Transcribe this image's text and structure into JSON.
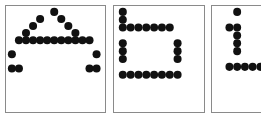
{
  "figure": {
    "background_color": "#ffffff",
    "border_color": "#8a8a8a",
    "dot_color": "#111111",
    "panel_count": 3
  },
  "panels": [
    {
      "id": "panel-letter-a",
      "letter": "A",
      "case": "uppercase",
      "clipped": false,
      "x": 5,
      "y": 5,
      "width": 101,
      "height": 108,
      "grid": {
        "cols": 13,
        "rows": 10,
        "cell": 7.2,
        "origin_x": 6,
        "origin_y": 6
      },
      "dot_radius": 4.1,
      "dots": [
        [
          6,
          0
        ],
        [
          4,
          1
        ],
        [
          7,
          1
        ],
        [
          3,
          2
        ],
        [
          8,
          2
        ],
        [
          2,
          3
        ],
        [
          9,
          3
        ],
        [
          1,
          4
        ],
        [
          2,
          4
        ],
        [
          3,
          4
        ],
        [
          4,
          4
        ],
        [
          5,
          4
        ],
        [
          6,
          4
        ],
        [
          7,
          4
        ],
        [
          8,
          4
        ],
        [
          9,
          4
        ],
        [
          10,
          4
        ],
        [
          11,
          4
        ],
        [
          0,
          6
        ],
        [
          12,
          6
        ],
        [
          0,
          8
        ],
        [
          1,
          8
        ],
        [
          11,
          8
        ],
        [
          12,
          8
        ]
      ]
    },
    {
      "id": "panel-letter-h",
      "letter": "h",
      "case": "lowercase",
      "clipped": false,
      "x": 113,
      "y": 5,
      "width": 92,
      "height": 108,
      "grid": {
        "cols": 10,
        "rows": 10,
        "cell": 8.0,
        "origin_x": 9,
        "origin_y": 6
      },
      "dot_radius": 4.1,
      "dots": [
        [
          0,
          0
        ],
        [
          0,
          1
        ],
        [
          0,
          2
        ],
        [
          1,
          2
        ],
        [
          2,
          2
        ],
        [
          3,
          2
        ],
        [
          4,
          2
        ],
        [
          5,
          2
        ],
        [
          6,
          2
        ],
        [
          0,
          4
        ],
        [
          7,
          4
        ],
        [
          0,
          5
        ],
        [
          7,
          5
        ],
        [
          0,
          6
        ],
        [
          7,
          6
        ],
        [
          0,
          8
        ],
        [
          1,
          8
        ],
        [
          2,
          8
        ],
        [
          3,
          8
        ],
        [
          4,
          8
        ],
        [
          5,
          8
        ],
        [
          6,
          8
        ],
        [
          7,
          8
        ]
      ]
    },
    {
      "id": "panel-letter-i",
      "letter": "i",
      "case": "lowercase",
      "clipped": true,
      "clipped_edge": "right",
      "x": 211,
      "y": 5,
      "width": 62,
      "height": 108,
      "grid": {
        "cols": 8,
        "rows": 10,
        "cell": 8.0,
        "origin_x": 10,
        "origin_y": 6
      },
      "dot_radius": 4.1,
      "dots": [
        [
          2,
          0
        ],
        [
          1,
          2
        ],
        [
          2,
          2
        ],
        [
          2,
          3
        ],
        [
          2,
          4
        ],
        [
          2,
          5
        ],
        [
          1,
          7
        ],
        [
          2,
          7
        ],
        [
          3,
          7
        ],
        [
          4,
          7
        ],
        [
          5,
          7
        ]
      ]
    }
  ]
}
